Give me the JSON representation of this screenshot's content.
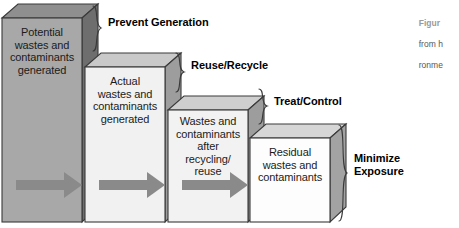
{
  "diagram": {
    "boxes": [
      {
        "id": "potential-wastes",
        "text": "Potential\nwastes and\ncontaminants\ngenerated",
        "front_color": "#a8a8a8",
        "side_color": "#6e6e6e",
        "top_color": "#8f8f8f",
        "has_arrow": true
      },
      {
        "id": "actual-wastes",
        "text": "Actual\nwastes and\ncontaminants\ngenerated",
        "front_color": "#f1f1f1",
        "side_color": "#9d9d9d",
        "top_color": "#c9c9c9",
        "has_arrow": true
      },
      {
        "id": "wastes-after-recycling",
        "text": "Wastes and\ncontaminants\nafter\nrecycling/\nreuse",
        "front_color": "#f2f2f2",
        "side_color": "#9d9d9d",
        "top_color": "#cfcfcf",
        "has_arrow": true
      },
      {
        "id": "residual-wastes",
        "text": "Residual\nwastes and\ncontaminants",
        "front_color": "#fdfdfd",
        "side_color": "#a3a3a3",
        "top_color": "#d6d6d6",
        "has_arrow": false
      }
    ],
    "tiers": [
      {
        "id": "prevent-generation",
        "label": "Prevent Generation"
      },
      {
        "id": "reuse-recycle",
        "label": "Reuse/Recycle"
      },
      {
        "id": "treat-control",
        "label": "Treat/Control"
      },
      {
        "id": "minimize-exposure",
        "label": "Minimize\nExposure"
      }
    ],
    "arrow_color": "#8a8a8a",
    "outline_color": "#3a3a3a"
  },
  "caption": {
    "head": "Figur",
    "line2": "from h",
    "line3": "ronme"
  }
}
